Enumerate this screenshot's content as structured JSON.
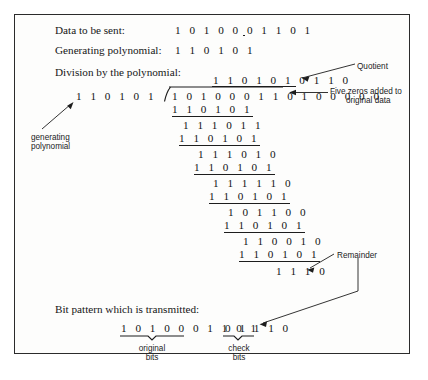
{
  "figure": {
    "labels": {
      "data_to_be_sent": "Data to be sent:",
      "generating_polynomial": "Generating polynomial:",
      "division_by_polynomial": "Division by the polynomial:",
      "bit_pattern_transmitted": "Bit pattern which is transmitted:"
    },
    "values": {
      "data_to_be_sent": "1 0 1 0 0 0 1 1 0 1",
      "generating_polynomial": "1 1 0 1 0 1",
      "quotient": "1 1 0 1 0 1 0 1 1 0",
      "divisor": "1 1 0 1 0 1",
      "dividend": "1 0 1 0 0 0 1 1 0 1 0 0 0 0 0",
      "remainder": "1 1 1 0",
      "transmitted_original_bits": "1 0 1 0 0 0 1 1 0 1",
      "transmitted_check_bits": "0 1 1 1 0"
    },
    "division_steps": [
      {
        "subtrahend": "1 1 0 1 0 1",
        "difference": "1 1 1 0 1 1"
      },
      {
        "subtrahend": "1 1 0 1 0 1",
        "difference": "1 1 1 0 1 0"
      },
      {
        "subtrahend": "1 1 0 1 0 1",
        "difference": "1 1 1 1 1 0"
      },
      {
        "subtrahend": "1 1 0 1 0 1",
        "difference": "1 0 1 1 0 0"
      },
      {
        "subtrahend": "1 1 0 1 0 1",
        "difference": "1 1 0 0 1 0"
      },
      {
        "subtrahend": "1 1 0 1 0 1",
        "difference": "1 1 1 0"
      }
    ],
    "annotations": {
      "quotient": "Quotient",
      "five_zeros_line1": "Five zeros added to",
      "five_zeros_line2": "original data",
      "generating_polynomial_line1": "generating",
      "generating_polynomial_line2": "polynomial",
      "remainder": "Remainder",
      "original_bits_line1": "original",
      "original_bits_line2": "bits",
      "check_bits_line1": "check",
      "check_bits_line2": "bits"
    },
    "colors": {
      "ink": "#161616",
      "frame": "#2b2b2b",
      "paper": "#fdfdfc"
    }
  }
}
